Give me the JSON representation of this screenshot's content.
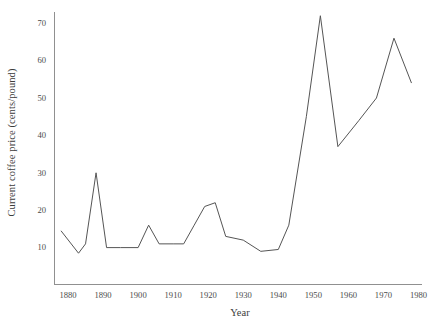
{
  "chart_data": {
    "type": "line",
    "title": "",
    "xlabel": "Year",
    "ylabel": "Current coffee price (cents/pound)",
    "xlim": [
      1876,
      1981
    ],
    "ylim": [
      0,
      73
    ],
    "xticks": [
      1880,
      1890,
      1900,
      1910,
      1920,
      1930,
      1940,
      1950,
      1960,
      1970,
      1980
    ],
    "yticks": [
      10,
      20,
      30,
      40,
      50,
      60,
      70
    ],
    "grid": false,
    "legend": false,
    "line_color": "#555555",
    "series": [
      {
        "name": "Current coffee price",
        "x": [
          1878,
          1883,
          1885,
          1888,
          1891,
          1895,
          1900,
          1903,
          1906,
          1910,
          1913,
          1916,
          1919,
          1922,
          1925,
          1930,
          1935,
          1940,
          1943,
          1948,
          1952,
          1957,
          1963,
          1968,
          1973,
          1978
        ],
        "values": [
          14.5,
          8.5,
          11.0,
          30.0,
          10.0,
          10.0,
          10.0,
          16.0,
          11.0,
          11.0,
          11.0,
          16.0,
          21.0,
          22.0,
          13.0,
          12.0,
          9.0,
          9.5,
          16.0,
          45.0,
          72.0,
          37.0,
          44.0,
          50.0,
          66.0,
          54.0
        ]
      }
    ]
  },
  "axis": {
    "color": "#808080"
  }
}
